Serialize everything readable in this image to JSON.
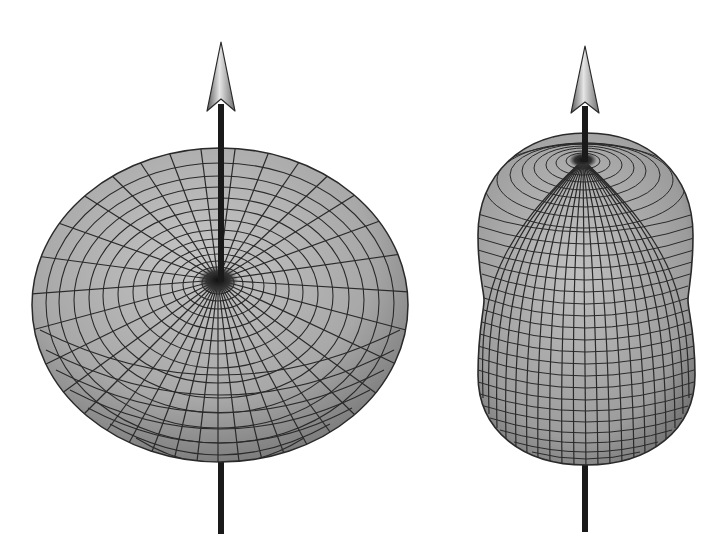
{
  "figure": {
    "description": "Two 3D radiation pattern surfaces, each pierced by a vertical axis arrow",
    "background": "#ffffff",
    "colors": {
      "surface_light": "#c8c8c8",
      "surface_mid": "#9a9a9a",
      "surface_dark": "#4a4a4a",
      "grid_line": "#2a2a2a",
      "axis": "#1a1a1a",
      "arrowhead_light": "#e0e0e0",
      "arrowhead_dark": "#6e6e6e"
    },
    "panels": [
      {
        "id": "left",
        "shape": "torus-like doughnut pattern viewed from above at an angle",
        "axis": {
          "x": 221,
          "tip_y": 42,
          "bottom_y": 534
        },
        "surface": {
          "cx": 220,
          "cy": 305,
          "rx": 188,
          "ry": 157,
          "pole_x": 218,
          "pole_y": 280
        }
      },
      {
        "id": "right",
        "shape": "elongated peanut-shaped pattern",
        "axis": {
          "x": 585,
          "tip_y": 46,
          "bottom_y": 532
        },
        "surface": {
          "cx": 586,
          "top_y": 133,
          "bottom_y": 465,
          "half_width": 108,
          "waist_y": 300,
          "pole_x": 583,
          "pole_y": 160
        }
      }
    ]
  }
}
